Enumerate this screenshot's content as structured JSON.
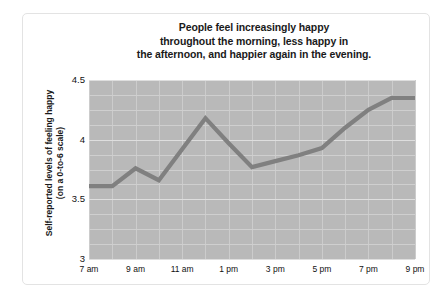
{
  "chart_data": {
    "type": "line",
    "title": "People feel increasingly happy throughout the morning, less happy in the afternoon, and happier again in the evening.",
    "title_lines": [
      "People feel increasingly happy",
      "throughout the morning, less happy in",
      "the afternoon, and happier again in the evening."
    ],
    "xlabel": "",
    "ylabel": "Self-reported levels of feeling happy (on a 0-to-6 scale)",
    "ylabel_lines": [
      "Self-reported levels of feeling happy",
      "(on a 0-to-6 scale)"
    ],
    "x": [
      "7 am",
      "8 am",
      "9 am",
      "10 am",
      "11 am",
      "12 pm",
      "1 pm",
      "2 pm",
      "3 pm",
      "4 pm",
      "5 pm",
      "6 pm",
      "7 pm",
      "8 pm",
      "9 pm"
    ],
    "values": [
      3.61,
      3.61,
      3.76,
      3.66,
      3.92,
      4.18,
      3.97,
      3.77,
      3.82,
      3.87,
      3.93,
      4.1,
      4.25,
      4.35,
      4.35
    ],
    "xtick_labels": [
      "7 am",
      "9 am",
      "11 am",
      "1 pm",
      "3 pm",
      "5 pm",
      "7 pm",
      "9 pm"
    ],
    "xtick_indices": [
      0,
      2,
      4,
      6,
      8,
      10,
      12,
      14
    ],
    "ytick_labels": [
      "4.5",
      "4",
      "3.5",
      "3"
    ],
    "ytick_values": [
      4.5,
      4,
      3.5,
      3
    ],
    "ylim": [
      3,
      4.5
    ],
    "grid": true,
    "legend": "none",
    "colors": {
      "line": "#808080",
      "plot_background": "#b9b9b9",
      "gridline": "#cfcfcf",
      "text": "#111111",
      "card_background": "#ffffff",
      "card_border": "#e3e3e3"
    }
  }
}
